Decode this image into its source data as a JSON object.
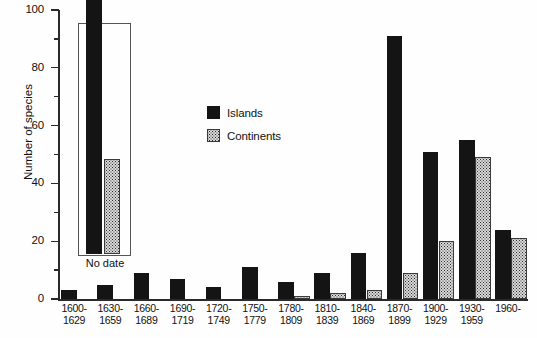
{
  "chart_data": {
    "type": "bar",
    "title": "",
    "xlabel": "",
    "ylabel": "Number of species",
    "ylim": [
      0,
      100
    ],
    "ytick_values": [
      0,
      20,
      40,
      60,
      80,
      100
    ],
    "ytick_labels": [
      "0",
      "20",
      "40",
      "60",
      "80",
      "100"
    ],
    "yminor_values": [
      10,
      30,
      50,
      70,
      90
    ],
    "grid": false,
    "legend_position": "upper-center-left",
    "categories": [
      "1600-\n1629",
      "1630-\n1659",
      "1660-\n1689",
      "1690-\n1719",
      "1720-\n1749",
      "1750-\n1779",
      "1780-\n1809",
      "1810-\n1839",
      "1840-\n1869",
      "1870-\n1899",
      "1900-\n1929",
      "1930-\n1959",
      "1960-"
    ],
    "category_lines": [
      [
        "1600-",
        "1629"
      ],
      [
        "1630-",
        "1659"
      ],
      [
        "1660-",
        "1689"
      ],
      [
        "1690-",
        "1719"
      ],
      [
        "1720-",
        "1749"
      ],
      [
        "1750-",
        "1779"
      ],
      [
        "1780-",
        "1809"
      ],
      [
        "1810-",
        "1839"
      ],
      [
        "1840-",
        "1869"
      ],
      [
        "1870-",
        "1899"
      ],
      [
        "1900-",
        "1929"
      ],
      [
        "1930-",
        "1959"
      ],
      [
        "1960-",
        ""
      ]
    ],
    "series": [
      {
        "name": "Islands",
        "color": "#141414",
        "fill": "solid-black",
        "values": [
          3,
          5,
          9,
          7,
          4,
          11,
          6,
          9,
          16,
          91,
          51,
          55,
          24
        ]
      },
      {
        "name": "Continents",
        "color": "#d8d8d8",
        "fill": "dotted-stipple",
        "values": [
          0,
          0,
          0,
          0,
          0,
          0,
          1,
          2,
          3,
          9,
          20,
          49,
          21
        ]
      }
    ],
    "annotations": [
      {
        "name": "no-date-inset",
        "label": "No date",
        "islands_value": 90,
        "continents_value": 33,
        "boxed": true
      }
    ]
  },
  "legend": {
    "entries": [
      {
        "label": "Islands"
      },
      {
        "label": "Continents"
      }
    ]
  }
}
